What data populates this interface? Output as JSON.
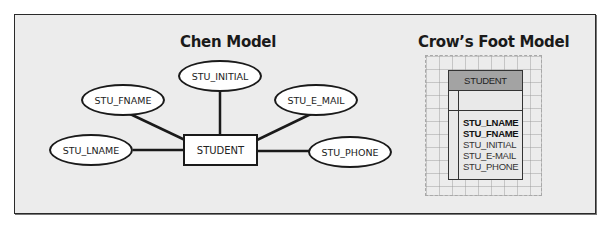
{
  "chen": {
    "title": "Chen Model",
    "entity": "STUDENT",
    "attributes": {
      "initial": "STU_INITIAL",
      "fname": "STU_FNAME",
      "email": "STU_E_MAIL",
      "lname": "STU_LNAME",
      "phone": "STU_PHONE"
    }
  },
  "crowsfoot": {
    "title": "Crow’s Foot Model",
    "entity": "STUDENT",
    "attributes": [
      {
        "name": "STU_LNAME",
        "bold": true
      },
      {
        "name": "STU_FNAME",
        "bold": true
      },
      {
        "name": "STU_INITIAL",
        "bold": false
      },
      {
        "name": "STU_E-MAIL",
        "bold": false
      },
      {
        "name": "STU_PHONE",
        "bold": false
      }
    ]
  },
  "colors": {
    "background": "#ececec",
    "stroke": "#1a1a1a",
    "header_fill": "#a3a3a3"
  }
}
